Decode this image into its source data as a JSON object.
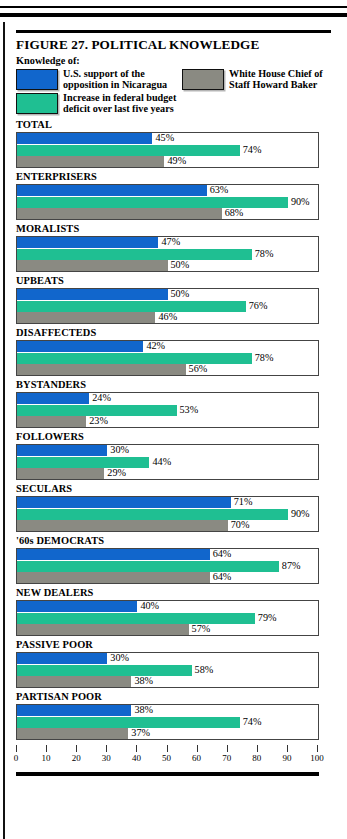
{
  "figure": {
    "title": "FIGURE 27. POLITICAL KNOWLEDGE",
    "legend_heading": "Knowledge of:"
  },
  "legend": {
    "items": [
      {
        "label_line1": "U.S. support of the",
        "label_line2": "opposition in Nicaragua",
        "color": "#1166CC",
        "swatch": "blue-swatch"
      },
      {
        "label_line1": "White House Chief of",
        "label_line2": "Staff Howard Baker",
        "color": "#8A8A82",
        "swatch": "gray-swatch"
      },
      {
        "label_line1": "Increase in federal budget",
        "label_line2": "deficit over last five years",
        "color": "#1FBF92",
        "swatch": "green-swatch"
      }
    ]
  },
  "axis": {
    "ticks": [
      "0",
      "10",
      "20",
      "30",
      "40",
      "50",
      "60",
      "70",
      "80",
      "90",
      "100"
    ],
    "min": 0,
    "max": 100
  },
  "chart_data": {
    "type": "bar",
    "title": "FIGURE 27. POLITICAL KNOWLEDGE",
    "subtitle": "Knowledge of:",
    "orientation": "horizontal",
    "grouped": true,
    "xlabel": "",
    "ylabel": "",
    "xlim": [
      0,
      100
    ],
    "grid": false,
    "legend_position": "top",
    "value_suffix": "%",
    "categories": [
      "TOTAL",
      "ENTERPRISERS",
      "MORALISTS",
      "UPBEATS",
      "DISAFFECTEDS",
      "BYSTANDERS",
      "FOLLOWERS",
      "SECULARS",
      "'60s DEMOCRATS",
      "NEW DEALERS",
      "PASSIVE POOR",
      "PARTISAN POOR"
    ],
    "series": [
      {
        "name": "U.S. support of the opposition in Nicaragua",
        "color": "#1166CC",
        "values": [
          45,
          63,
          47,
          50,
          42,
          24,
          30,
          71,
          64,
          40,
          30,
          38
        ]
      },
      {
        "name": "Increase in federal budget deficit over last five years",
        "color": "#1FBF92",
        "values": [
          74,
          90,
          78,
          76,
          78,
          53,
          44,
          90,
          87,
          79,
          58,
          74
        ]
      },
      {
        "name": "White House Chief of Staff Howard Baker",
        "color": "#8A8A82",
        "values": [
          49,
          68,
          50,
          46,
          56,
          23,
          29,
          70,
          64,
          57,
          38,
          37
        ]
      }
    ]
  }
}
